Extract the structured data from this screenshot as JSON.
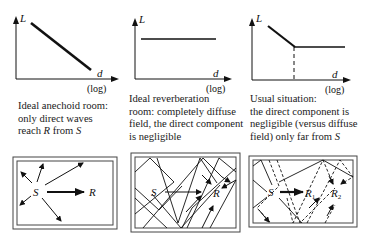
{
  "graphs": [
    {
      "y_label": "L",
      "x_label": "d",
      "x_scale": "(log)",
      "shape": "decreasing-line"
    },
    {
      "y_label": "L",
      "x_label": "d",
      "x_scale": "(log)",
      "shape": "constant-line"
    },
    {
      "y_label": "L",
      "x_label": "d",
      "x_scale": "(log)",
      "shape": "decreasing-then-constant",
      "marker": "dashed-vertical-at-knee"
    }
  ],
  "captions": [
    {
      "lines": [
        "Ideal anechoid room:",
        "only direct waves",
        "reach R from S"
      ]
    },
    {
      "lines": [
        "Ideal reverberation",
        "room: completely diffuse",
        "field, the direct component",
        "is negligible"
      ]
    },
    {
      "lines": [
        "Usual situation:",
        "the direct component is",
        "negligible (versus diffuse",
        "field) only far from S"
      ]
    }
  ],
  "rooms": [
    {
      "source": "S",
      "receivers": [
        "R"
      ],
      "type": "direct-only"
    },
    {
      "source": "S",
      "receivers": [
        "R"
      ],
      "type": "diffuse-reflections"
    },
    {
      "source": "S",
      "receivers": [
        "R1",
        "R2"
      ],
      "type": "mixed"
    }
  ],
  "room_labels": {
    "s": "S",
    "r": "R",
    "r1_base": "R",
    "r1_sub": "1",
    "r2_base": "R",
    "r2_sub": "2"
  }
}
